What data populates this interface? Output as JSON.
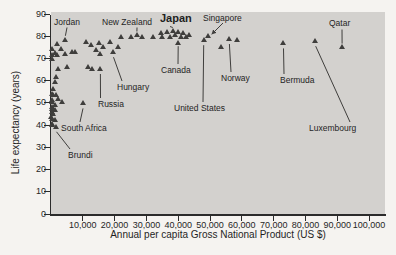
{
  "chart_data": {
    "type": "scatter",
    "title": "",
    "xlabel": "Annual per capita Gross National Product (US $)",
    "ylabel": "Life expectancy (years)",
    "xlim": [
      0,
      105000
    ],
    "ylim": [
      0,
      90
    ],
    "grid": false,
    "plot_background": "#d3d1ce",
    "marker": {
      "shape": "triangle-up",
      "color": "#3f3e3c",
      "size_px": 6
    },
    "x_ticks": [
      {
        "value": 10000,
        "label": "10,000"
      },
      {
        "value": 20000,
        "label": "20,000"
      },
      {
        "value": 30000,
        "label": "30,000"
      },
      {
        "value": 40000,
        "label": "40,000"
      },
      {
        "value": 50000,
        "label": "50,000"
      },
      {
        "value": 60000,
        "label": "60,000"
      },
      {
        "value": 70000,
        "label": "70,000"
      },
      {
        "value": 80000,
        "label": "80,000"
      },
      {
        "value": 90000,
        "label": "90,000"
      },
      {
        "value": 100000,
        "label": "100,000"
      }
    ],
    "y_ticks": [
      {
        "value": 0,
        "label": "0"
      },
      {
        "value": 10,
        "label": "10"
      },
      {
        "value": 20,
        "label": "20"
      },
      {
        "value": 30,
        "label": "30"
      },
      {
        "value": 40,
        "label": "40"
      },
      {
        "value": 50,
        "label": "50"
      },
      {
        "value": 60,
        "label": "60"
      },
      {
        "value": 70,
        "label": "70"
      },
      {
        "value": 80,
        "label": "80"
      },
      {
        "value": 90,
        "label": "90"
      }
    ],
    "points": [
      [
        1900,
        76
      ],
      [
        250,
        74
      ],
      [
        3000,
        74
      ],
      [
        1250,
        72
      ],
      [
        200,
        71
      ],
      [
        7600,
        72.5
      ],
      [
        250,
        69.5
      ],
      [
        1900,
        71
      ],
      [
        4400,
        71.5
      ],
      [
        6500,
        72.5
      ],
      [
        5000,
        65.5
      ],
      [
        11500,
        65.5
      ],
      [
        13000,
        65
      ],
      [
        2250,
        65
      ],
      [
        1500,
        61
      ],
      [
        1250,
        59
      ],
      [
        600,
        56
      ],
      [
        1500,
        53
      ],
      [
        200,
        53.5
      ],
      [
        600,
        53
      ],
      [
        2250,
        51.5
      ],
      [
        3500,
        50
      ],
      [
        200,
        51
      ],
      [
        300,
        50
      ],
      [
        1250,
        48.5
      ],
      [
        200,
        47.5
      ],
      [
        300,
        47
      ],
      [
        1250,
        46.5
      ],
      [
        200,
        45.5
      ],
      [
        600,
        44.5
      ],
      [
        100,
        43
      ],
      [
        300,
        42.5
      ],
      [
        1250,
        42
      ],
      [
        200,
        40
      ],
      [
        300,
        39.5
      ],
      [
        11000,
        77
      ],
      [
        12500,
        75.5
      ],
      [
        14000,
        73.5
      ],
      [
        15000,
        76.5
      ],
      [
        15500,
        71.5
      ],
      [
        16500,
        74.5
      ],
      [
        18500,
        77
      ],
      [
        21000,
        74.5
      ],
      [
        22000,
        79
      ],
      [
        25000,
        79
      ],
      [
        28500,
        79
      ],
      [
        32000,
        79
      ],
      [
        34500,
        81
      ],
      [
        35000,
        79
      ],
      [
        36500,
        81.5
      ],
      [
        37500,
        79
      ],
      [
        39000,
        80
      ],
      [
        40000,
        81.5
      ],
      [
        41000,
        79
      ],
      [
        41500,
        81
      ],
      [
        42500,
        79
      ],
      [
        43500,
        80
      ],
      [
        53500,
        74.5
      ],
      [
        58500,
        78
      ]
    ],
    "callouts": [
      {
        "label": "Jordan",
        "x": 4500,
        "y": 78,
        "label_px": {
          "left": 54,
          "top": 17
        },
        "line": {
          "x1": 67,
          "y1": 27.5,
          "x2": 65.4,
          "y2": 35.8
        },
        "arrow": false,
        "big": false
      },
      {
        "label": "New Zealand",
        "x": 27000,
        "y": 80,
        "label_px": {
          "left": 102,
          "top": 17
        },
        "line": {
          "x1": 137,
          "y1": 27.5,
          "x2": 136.9,
          "y2": 31.5
        },
        "arrow": false,
        "big": false
      },
      {
        "label": "Japan",
        "x": 38500,
        "y": 82,
        "label_px": {
          "left": 160,
          "top": 13
        },
        "line": {
          "x1": 170,
          "y1": 26.5,
          "x2": 172.8,
          "y2": 27.5
        },
        "arrow": false,
        "big": true
      },
      {
        "label": "Singapore",
        "x": 49500,
        "y": 79.5,
        "label_px": {
          "left": 203,
          "top": 13
        },
        "line": {
          "x1": 223,
          "y1": 23,
          "x2": 211.8,
          "y2": 34.2
        },
        "arrow": true,
        "big": false
      },
      {
        "label": "Qatar",
        "x": 91500,
        "y": 74.5,
        "label_px": {
          "left": 329,
          "top": 18
        },
        "line": {
          "x1": 342,
          "y1": 29.5,
          "x2": 342.1,
          "y2": 43.6
        },
        "arrow": false,
        "big": false
      },
      {
        "label": "Canada",
        "x": 40000,
        "y": 76.5,
        "label_px": {
          "left": 161,
          "top": 65
        },
        "line": {
          "x1": 178,
          "y1": 64,
          "x2": 178.2,
          "y2": 46.2
        },
        "arrow": false,
        "big": false
      },
      {
        "label": "Norway",
        "x": 56000,
        "y": 78.5,
        "label_px": {
          "left": 221,
          "top": 73
        },
        "line": {
          "x1": 231,
          "y1": 72,
          "x2": 229.4,
          "y2": 44
        },
        "arrow": false,
        "big": false
      },
      {
        "label": "Hungary",
        "x": 19500,
        "y": 72.5,
        "label_px": {
          "left": 117,
          "top": 82
        },
        "line": {
          "x1": 122,
          "y1": 81,
          "x2": 113.5,
          "y2": 57.2
        },
        "arrow": false,
        "big": false
      },
      {
        "label": "Russia",
        "x": 15500,
        "y": 65,
        "label_px": {
          "left": 98,
          "top": 99
        },
        "line": {
          "x1": 100.5,
          "y1": 98,
          "x2": 100.4,
          "y2": 74
        },
        "arrow": false,
        "big": false
      },
      {
        "label": "United States",
        "x": 48000,
        "y": 78,
        "label_px": {
          "left": 174,
          "top": 103
        },
        "line": {
          "x1": 203,
          "y1": 102,
          "x2": 203.7,
          "y2": 45.2
        },
        "arrow": false,
        "big": false
      },
      {
        "label": "Bermuda",
        "x": 73000,
        "y": 76.5,
        "label_px": {
          "left": 280,
          "top": 75
        },
        "line": {
          "x1": 284,
          "y1": 74,
          "x2": 283.5,
          "y2": 48.4
        },
        "arrow": false,
        "big": false
      },
      {
        "label": "South Africa",
        "x": 10000,
        "y": 49.5,
        "label_px": {
          "left": 61,
          "top": 123
        },
        "line": {
          "x1": 80,
          "y1": 122,
          "x2": 83,
          "y2": 108.4
        },
        "arrow": false,
        "big": false
      },
      {
        "label": "Brundi",
        "x": 1500,
        "y": 38.5,
        "label_px": {
          "left": 68,
          "top": 150
        },
        "line": {
          "x1": 70,
          "y1": 149,
          "x2": 56.5,
          "y2": 131.8
        },
        "arrow": false,
        "big": false
      },
      {
        "label": "Luxembourg",
        "x": 83000,
        "y": 77.5,
        "label_px": {
          "left": 309,
          "top": 123
        },
        "line": {
          "x1": 350,
          "y1": 122,
          "x2": 315.7,
          "y2": 46.2
        },
        "arrow": false,
        "big": false
      }
    ]
  }
}
